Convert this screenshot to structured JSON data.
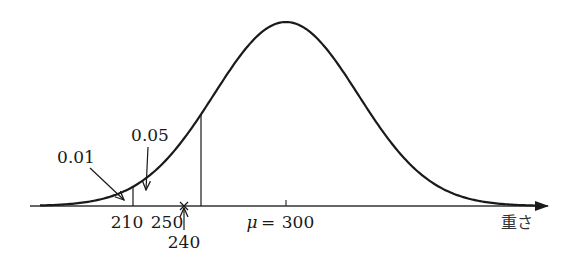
{
  "diagram": {
    "type": "normal-distribution",
    "mean": 300,
    "axis_label": "重さ",
    "mean_label_symbol": "μ",
    "mean_label_eq": "=",
    "mean_label_value": "300",
    "markers": [
      {
        "value": 210,
        "label": "210",
        "style": "vertical-line"
      },
      {
        "value": 240,
        "label": "240",
        "style": "cross-with-up-arrow"
      },
      {
        "value": 250,
        "label": "250",
        "style": "vertical-line"
      }
    ],
    "tail_annotations": [
      {
        "label": "0.01",
        "points_to_region_left_of": 210
      },
      {
        "label": "0.05",
        "points_to_region_left_of": 250
      }
    ],
    "colors": {
      "curve": "#1a1a1a",
      "axis": "#333333",
      "text": "#1a1a1a"
    }
  }
}
